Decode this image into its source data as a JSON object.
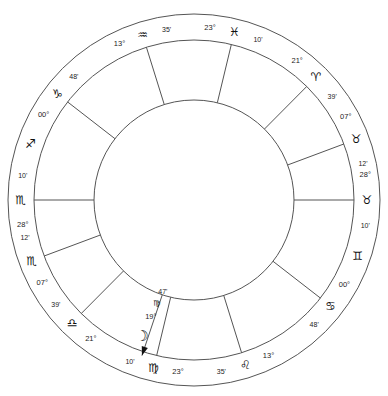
{
  "chart": {
    "type": "astrological-natal-wheel",
    "center": {
      "x": 194,
      "y": 200
    },
    "radii": {
      "outer": 186,
      "inner_ring": 160,
      "house_circle": 100
    },
    "house_cusps": [
      {
        "index": 1,
        "name": "ascendant",
        "degree": "28°",
        "sign_glyph": "♏",
        "sign_name": "Scorpio",
        "minute": "10'",
        "angle_deg": 180
      },
      {
        "index": 2,
        "name": "cusp-2",
        "degree": "07°",
        "sign_glyph": "♏",
        "sign_name": "Scorpio",
        "minute": "12'",
        "angle_deg": 200.5
      },
      {
        "index": 3,
        "name": "cusp-3",
        "degree": "21°",
        "sign_glyph": "♎",
        "sign_name": "Libra",
        "minute": "39'",
        "angle_deg": 225.2
      },
      {
        "index": 4,
        "name": "midheaven",
        "degree": "23°",
        "sign_glyph": "♍",
        "sign_name": "Virgo",
        "minute": "10'",
        "angle_deg": 256.5
      },
      {
        "index": 5,
        "name": "cusp-5",
        "degree": "13°",
        "sign_glyph": "♌",
        "sign_name": "Leo",
        "minute": "35'",
        "angle_deg": 287.3
      },
      {
        "index": 6,
        "name": "cusp-6",
        "degree": "00°",
        "sign_glyph": "♋",
        "sign_name": "Cancer",
        "minute": "48'",
        "angle_deg": 322.2
      },
      {
        "index": 7,
        "name": "descendant",
        "degree": "28°",
        "sign_glyph": "♉",
        "sign_name": "Taurus",
        "minute": "10'",
        "angle_deg": 0
      },
      {
        "index": 8,
        "name": "cusp-8",
        "degree": "07°",
        "sign_glyph": "♉",
        "sign_name": "Taurus",
        "minute": "12'",
        "angle_deg": 20.5
      },
      {
        "index": 9,
        "name": "cusp-9",
        "degree": "21°",
        "sign_glyph": "♈",
        "sign_name": "Aries",
        "minute": "39'",
        "angle_deg": 45.2
      },
      {
        "index": 10,
        "name": "imum-coeli",
        "degree": "23°",
        "sign_glyph": "♓",
        "sign_name": "Pisces",
        "minute": "10'",
        "angle_deg": 76.5
      },
      {
        "index": 11,
        "name": "cusp-11",
        "degree": "13°",
        "sign_glyph": "♒",
        "sign_name": "Aquarius",
        "minute": "35'",
        "angle_deg": 107.3
      },
      {
        "index": 12,
        "name": "cusp-12",
        "degree": "00°",
        "sign_glyph": "♑",
        "sign_name": "Capricorn",
        "minute": "48'",
        "angle_deg": 142.2
      }
    ],
    "sign_markers": [
      {
        "name": "gemini-marker",
        "glyph": "♊",
        "sign_name": "Gemini",
        "angle_deg": 341
      },
      {
        "name": "sagittarius-marker",
        "glyph": "♐",
        "sign_name": "Sagittarius",
        "angle_deg": 161
      }
    ],
    "planets": [
      {
        "name": "moon",
        "glyph": "☽",
        "body_name": "Moon",
        "degree": "19°",
        "sign_glyph": "♍",
        "sign_name": "Virgo",
        "minute": "47'",
        "angle_deg": 251.5
      }
    ],
    "colors": {
      "stroke": "#555555",
      "text": "#1c1c1c",
      "background": "#ffffff"
    }
  }
}
